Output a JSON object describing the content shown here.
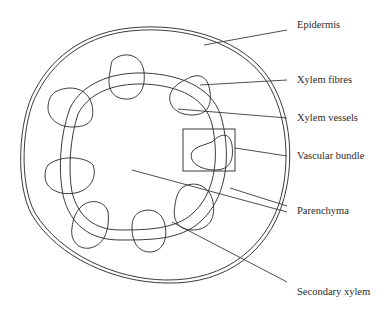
{
  "diagram": {
    "labels": {
      "epidermis": "Epidermis",
      "xylem_fibres": "Xylem fibres",
      "xylem_vessels": "Xylem vessels",
      "vascular_bundle": "Vascular bundle",
      "parenchyma": "Parenchyma",
      "secondary_xylem": "Secondary xylem"
    },
    "colors": {
      "line": "#3a3a3a",
      "text": "#2a2a2a",
      "background": "#ffffff"
    },
    "vascular_bundle_count": 8
  }
}
